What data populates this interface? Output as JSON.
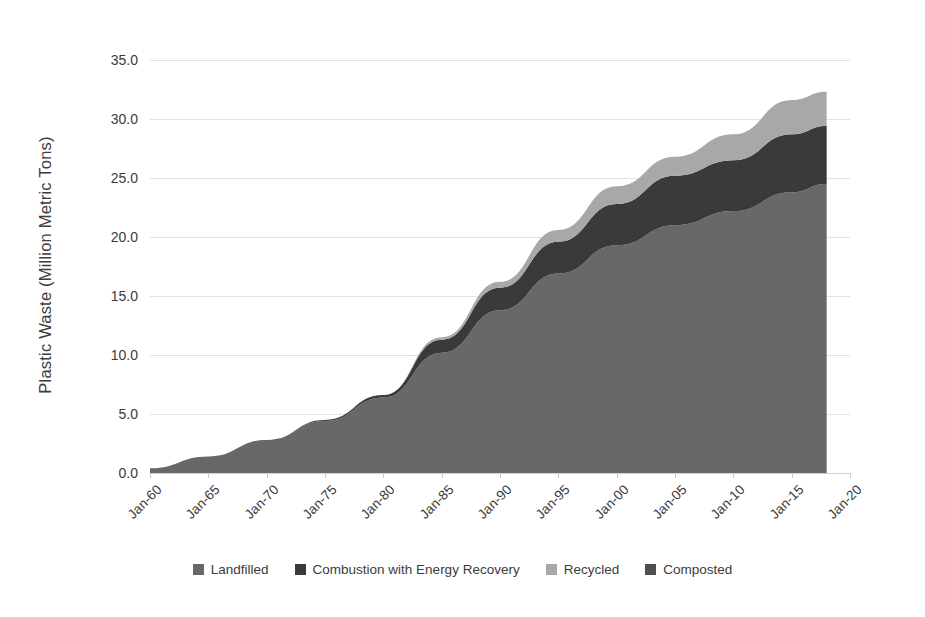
{
  "chart_data": {
    "type": "area",
    "stacked": true,
    "title": "",
    "subtitle": "",
    "xlabel": "",
    "ylabel": "Plastic Waste (Million Metric Tons)",
    "ylim": [
      0.0,
      35.0
    ],
    "ytick_labels": [
      "0.0",
      "5.0",
      "10.0",
      "15.0",
      "20.0",
      "25.0",
      "30.0",
      "35.0"
    ],
    "ytick_values": [
      0.0,
      5.0,
      10.0,
      15.0,
      20.0,
      25.0,
      30.0,
      35.0
    ],
    "grid": true,
    "legend_position": "bottom",
    "categories": [
      "Jan-60",
      "Jan-65",
      "Jan-70",
      "Jan-75",
      "Jan-80",
      "Jan-85",
      "Jan-90",
      "Jan-95",
      "Jan-00",
      "Jan-05",
      "Jan-10",
      "Jan-15",
      "Jan-20"
    ],
    "xtick_labels": [
      "Jan-60",
      "Jan-65",
      "Jan-70",
      "Jan-75",
      "Jan-80",
      "Jan-85",
      "Jan-90",
      "Jan-95",
      "Jan-00",
      "Jan-05",
      "Jan-10",
      "Jan-15",
      "Jan-20"
    ],
    "x": [
      1960,
      1965,
      1970,
      1975,
      1980,
      1985,
      1990,
      1995,
      2000,
      2005,
      2010,
      2015,
      2018
    ],
    "series": [
      {
        "name": "Landfilled",
        "color": "#686868",
        "values": [
          0.4,
          1.4,
          2.8,
          4.4,
          6.4,
          10.2,
          13.8,
          16.9,
          19.3,
          21.0,
          22.2,
          23.8,
          24.5
        ]
      },
      {
        "name": "Combustion with Energy Recovery",
        "color": "#3a3a3a",
        "values": [
          0.0,
          0.0,
          0.0,
          0.1,
          0.2,
          1.1,
          1.9,
          2.7,
          3.5,
          4.2,
          4.3,
          4.9,
          4.9
        ]
      },
      {
        "name": "Recycled",
        "color": "#a8a8a8",
        "values": [
          0.0,
          0.0,
          0.0,
          0.0,
          0.0,
          0.2,
          0.5,
          1.0,
          1.5,
          1.6,
          2.2,
          2.9,
          2.9
        ]
      },
      {
        "name": "Composted",
        "color": "#4f4f4f",
        "values": [
          0.0,
          0.0,
          0.0,
          0.0,
          0.0,
          0.0,
          0.0,
          0.0,
          0.0,
          0.0,
          0.0,
          0.0,
          0.0
        ]
      }
    ],
    "totals": [
      0.4,
      1.4,
      2.8,
      4.5,
      6.6,
      11.5,
      16.2,
      20.6,
      24.3,
      26.8,
      28.7,
      31.6,
      32.3
    ],
    "axis_colors": {
      "gridline": "#e2e2e2",
      "axis": "#d2d2d2",
      "text": "#3b3b3b"
    }
  },
  "legend": {
    "items": [
      {
        "label": "Landfilled",
        "color": "#686868"
      },
      {
        "label": "Combustion with Energy Recovery",
        "color": "#3a3a3a"
      },
      {
        "label": "Recycled",
        "color": "#a8a8a8"
      },
      {
        "label": "Composted",
        "color": "#4f4f4f"
      }
    ]
  }
}
